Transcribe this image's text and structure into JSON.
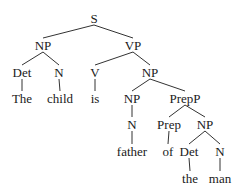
{
  "diagram": {
    "type": "syntax-tree",
    "nodes": [
      {
        "id": "S",
        "label": "S",
        "x": 94,
        "y": 18
      },
      {
        "id": "NP1",
        "label": "NP",
        "x": 43,
        "y": 45
      },
      {
        "id": "VP",
        "label": "VP",
        "x": 133,
        "y": 45
      },
      {
        "id": "Det1",
        "label": "Det",
        "x": 22,
        "y": 72
      },
      {
        "id": "N1",
        "label": "N",
        "x": 59,
        "y": 72
      },
      {
        "id": "V",
        "label": "V",
        "x": 95,
        "y": 72
      },
      {
        "id": "NP2",
        "label": "NP",
        "x": 150,
        "y": 72
      },
      {
        "id": "The",
        "label": "The",
        "x": 22,
        "y": 98
      },
      {
        "id": "child",
        "label": "child",
        "x": 60,
        "y": 98
      },
      {
        "id": "is",
        "label": "is",
        "x": 95,
        "y": 98
      },
      {
        "id": "NP3",
        "label": "NP",
        "x": 132,
        "y": 98
      },
      {
        "id": "PrepP",
        "label": "PrepP",
        "x": 185,
        "y": 98
      },
      {
        "id": "N2",
        "label": "N",
        "x": 132,
        "y": 124
      },
      {
        "id": "Prep",
        "label": "Prep",
        "x": 169,
        "y": 124
      },
      {
        "id": "NP4",
        "label": "NP",
        "x": 205,
        "y": 124
      },
      {
        "id": "father",
        "label": "father",
        "x": 132,
        "y": 151
      },
      {
        "id": "of",
        "label": "of",
        "x": 168,
        "y": 151
      },
      {
        "id": "Det2",
        "label": "Det",
        "x": 189,
        "y": 151
      },
      {
        "id": "N3",
        "label": "N",
        "x": 220,
        "y": 151
      },
      {
        "id": "the",
        "label": "the",
        "x": 190,
        "y": 178
      },
      {
        "id": "man",
        "label": "man",
        "x": 220,
        "y": 178
      }
    ],
    "edges": [
      [
        "S",
        "NP1"
      ],
      [
        "S",
        "VP"
      ],
      [
        "NP1",
        "Det1"
      ],
      [
        "NP1",
        "N1"
      ],
      [
        "VP",
        "V"
      ],
      [
        "VP",
        "NP2"
      ],
      [
        "Det1",
        "The"
      ],
      [
        "N1",
        "child"
      ],
      [
        "V",
        "is"
      ],
      [
        "NP2",
        "NP3"
      ],
      [
        "NP2",
        "PrepP"
      ],
      [
        "NP3",
        "N2"
      ],
      [
        "N2",
        "father"
      ],
      [
        "PrepP",
        "Prep"
      ],
      [
        "PrepP",
        "NP4"
      ],
      [
        "Prep",
        "of"
      ],
      [
        "NP4",
        "Det2"
      ],
      [
        "NP4",
        "N3"
      ],
      [
        "Det2",
        "the"
      ],
      [
        "N3",
        "man"
      ]
    ]
  }
}
